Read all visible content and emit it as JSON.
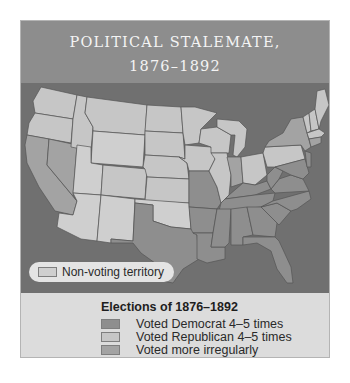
{
  "title": {
    "line1": "POLITICAL STALEMATE,",
    "line2": "1876–1892"
  },
  "map": {
    "background_color": "#707070",
    "nonvoting_label": "Non-voting territory",
    "colors": {
      "democrat": "#8e8e8e",
      "republican": "#c6c6c6",
      "irregular": "#a3a3a3",
      "nonvoting": "#cfcfcf",
      "border": "#555555"
    }
  },
  "legend": {
    "title": "Elections of 1876–1892",
    "items": [
      {
        "label": "Voted Democrat 4–5 times",
        "color": "#8e8e8e"
      },
      {
        "label": "Voted Republican 4–5 times",
        "color": "#c6c6c6"
      },
      {
        "label": "Voted more irregularly",
        "color": "#a3a3a3"
      }
    ]
  }
}
